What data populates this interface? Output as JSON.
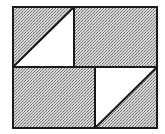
{
  "diagram": {
    "title": "",
    "colors": {
      "background": "#ffffff",
      "stipple_dark": "#6e6e6e",
      "stipple_light": "#d8d8d8",
      "line": "#1a1a1a",
      "white_region": "#ffffff"
    },
    "outer": {
      "x": 13,
      "y": 7,
      "w": 144,
      "h": 121
    },
    "top_divider_x": 74,
    "middle_y": 67,
    "bottom_divider_x": 95,
    "triangles": [
      {
        "name": "top-left-white-triangle",
        "points": "13,67 74,7 74,67"
      },
      {
        "name": "bottom-right-white-triangle",
        "points": "95,67 157,67 95,128"
      }
    ]
  }
}
